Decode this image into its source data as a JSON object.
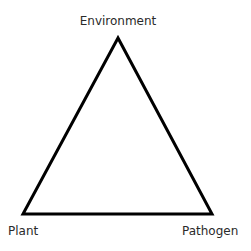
{
  "diagram": {
    "type": "disease-triangle",
    "vertices": {
      "top": {
        "label": "Environment",
        "x": 118,
        "y": 38
      },
      "bottom_left": {
        "label": "Plant",
        "x": 23,
        "y": 214
      },
      "bottom_right": {
        "label": "Pathogen",
        "x": 212,
        "y": 214
      }
    },
    "stroke_color": "#000000",
    "stroke_width": 3,
    "background_color": "#ffffff",
    "label_color": "#2a2a2a"
  }
}
